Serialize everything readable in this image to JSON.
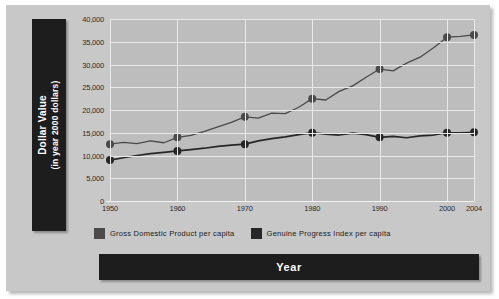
{
  "chart_data": {
    "type": "line",
    "title": "",
    "xlabel": "Year",
    "ylabel": "Dollar Value (in year 2000 dollars)",
    "ylabel_line1": "Dollar Value",
    "ylabel_line2": "(in year 2000 dollars)",
    "grid": true,
    "legend_position": "bottom",
    "xlim": [
      1950,
      2004
    ],
    "ylim": [
      0,
      40000
    ],
    "x": [
      1950,
      1960,
      1970,
      1980,
      1990,
      2000,
      2004
    ],
    "xtick_labels": [
      "1950",
      "1960",
      "1970",
      "1980",
      "1990",
      "2000",
      "2004"
    ],
    "ytick_labels": [
      "0",
      "5,000",
      "10,000",
      "15,000",
      "20,000",
      "25,000",
      "30,000",
      "35,000",
      "40,000"
    ],
    "ytick_values": [
      0,
      5000,
      10000,
      15000,
      20000,
      25000,
      30000,
      35000,
      40000
    ],
    "series": [
      {
        "name": "Gross Domestic Product per capita",
        "color": "#4a4a4a",
        "marker": "circle",
        "values": [
          12500,
          14000,
          18500,
          22500,
          29000,
          36000,
          36500
        ],
        "dense_x": [
          1950,
          1952,
          1954,
          1956,
          1958,
          1960,
          1962,
          1964,
          1966,
          1968,
          1970,
          1972,
          1974,
          1976,
          1978,
          1980,
          1982,
          1984,
          1986,
          1988,
          1990,
          1992,
          1994,
          1996,
          1998,
          2000,
          2002,
          2004
        ],
        "dense_values": [
          12500,
          12900,
          12600,
          13200,
          12800,
          14000,
          14400,
          15300,
          16300,
          17300,
          18500,
          18200,
          19300,
          19200,
          20600,
          22500,
          22200,
          24100,
          25300,
          27200,
          29000,
          28600,
          30300,
          31600,
          33700,
          36000,
          36200,
          36500
        ]
      },
      {
        "name": "Genuine Progress Index per capita",
        "color": "#272727",
        "marker": "circle",
        "values": [
          9000,
          11000,
          12500,
          15000,
          14000,
          15000,
          15100
        ],
        "dense_x": [
          1950,
          1952,
          1954,
          1956,
          1958,
          1960,
          1962,
          1964,
          1966,
          1968,
          1970,
          1972,
          1974,
          1976,
          1978,
          1980,
          1982,
          1984,
          1986,
          1988,
          1990,
          1992,
          1994,
          1996,
          1998,
          2000,
          2002,
          2004
        ],
        "dense_values": [
          9000,
          9500,
          10000,
          10400,
          10700,
          11000,
          11300,
          11600,
          12000,
          12300,
          12500,
          13200,
          13700,
          14100,
          14600,
          15000,
          14700,
          14500,
          14900,
          14600,
          14000,
          14200,
          13900,
          14300,
          14500,
          15000,
          15000,
          15100
        ]
      }
    ]
  }
}
